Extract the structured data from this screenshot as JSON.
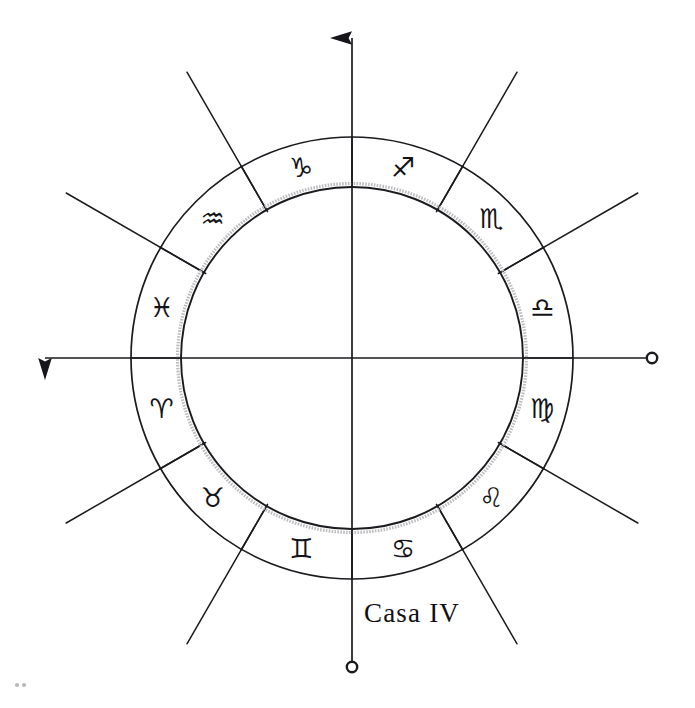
{
  "diagram": {
    "caption": "Casa IV",
    "center": {
      "x": 352,
      "y": 358
    },
    "radii": {
      "outer": 221,
      "inner": 171,
      "inner_shadow": 175,
      "spoke_outer": 330
    },
    "colors": {
      "ink": "#1b1b1f",
      "glyph": "#141418",
      "paper": "#ffffff",
      "shadow": "#b5b5b8"
    },
    "axes": [
      {
        "name": "ascendant-axis",
        "label": "horizontal-axis",
        "angle_deg": 180,
        "marker": "arrow"
      },
      {
        "name": "descendant-axis",
        "label": "horizontal-axis",
        "angle_deg": 0,
        "marker": "circle"
      },
      {
        "name": "midheaven-axis",
        "label": "vertical-axis",
        "angle_deg": 90,
        "marker": "arrow"
      },
      {
        "name": "imum-coeli-axis",
        "label": "vertical-axis",
        "angle_deg": 270,
        "marker": "circle"
      }
    ],
    "signs": [
      {
        "id": "sagittarius",
        "name": "Sagitario",
        "glyph": "♐",
        "angle_deg": 75,
        "glyph_size": 27
      },
      {
        "id": "scorpio",
        "name": "Escorpio",
        "glyph": "♏",
        "angle_deg": 45,
        "glyph_size": 27
      },
      {
        "id": "libra",
        "name": "Libra",
        "glyph": "♎",
        "angle_deg": 15,
        "glyph_size": 27
      },
      {
        "id": "virgo",
        "name": "Virgo",
        "glyph": "♍",
        "angle_deg": 345,
        "glyph_size": 27
      },
      {
        "id": "leo",
        "name": "Leo",
        "glyph": "♌",
        "angle_deg": 315,
        "glyph_size": 27
      },
      {
        "id": "cancer",
        "name": "Cáncer",
        "glyph": "♋",
        "angle_deg": 285,
        "glyph_size": 27
      },
      {
        "id": "gemini",
        "name": "Géminis",
        "glyph": "♊",
        "angle_deg": 255,
        "glyph_size": 27
      },
      {
        "id": "taurus",
        "name": "Tauro",
        "glyph": "♉",
        "angle_deg": 225,
        "glyph_size": 27
      },
      {
        "id": "aries",
        "name": "Aries",
        "glyph": "♈",
        "angle_deg": 195,
        "glyph_size": 27
      },
      {
        "id": "pisces",
        "name": "Piscis",
        "glyph": "♓",
        "angle_deg": 165,
        "glyph_size": 27
      },
      {
        "id": "aquarius",
        "name": "Acuario",
        "glyph": "♒",
        "angle_deg": 135,
        "glyph_size": 27
      },
      {
        "id": "capricorn",
        "name": "Capricornio",
        "glyph": "♑",
        "angle_deg": 105,
        "glyph_size": 27
      }
    ],
    "cusp_angles_deg": [
      0,
      30,
      60,
      90,
      120,
      150,
      180,
      210,
      240,
      270,
      300,
      330
    ],
    "caption_position": {
      "x": 412,
      "y": 613
    }
  }
}
